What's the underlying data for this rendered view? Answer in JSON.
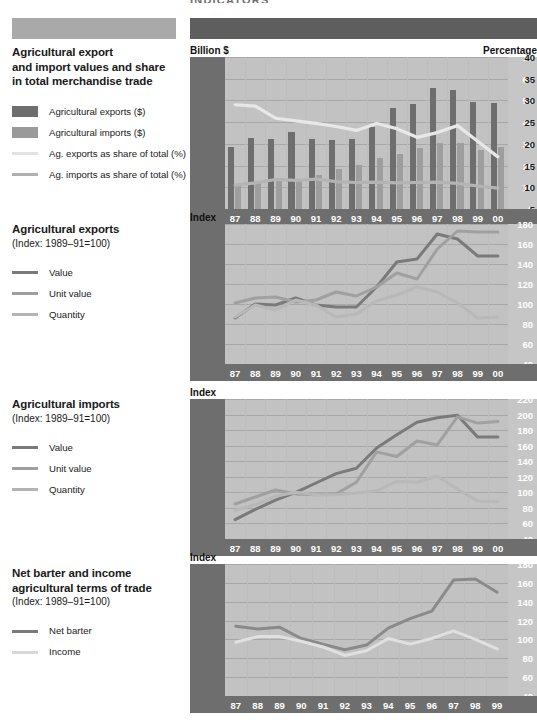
{
  "page": {
    "clipped_header_text": "INDICATORS",
    "header_bar_left_color": "#a9a9a9",
    "header_bar_right_color": "#5e5e5e"
  },
  "sections": [
    {
      "title_lines": [
        "Agricultural export",
        "and import values and share",
        "in total merchandise trade"
      ],
      "subtitle": "",
      "legend": [
        {
          "label": "Agricultural exports ($)",
          "swatch": "box",
          "color": "#6e6e6e"
        },
        {
          "label": "Agricultural imports ($)",
          "swatch": "box",
          "color": "#9a9a9a"
        },
        {
          "label": "Ag. exports as share of total (%)",
          "swatch": "line",
          "color": "#e3e3e3"
        },
        {
          "label": "Ag. imports as share of total (%)",
          "swatch": "line",
          "color": "#b0b0b0"
        }
      ],
      "left_caption": "Billion $",
      "right_caption": "Percentage"
    },
    {
      "title_lines": [
        "Agricultural exports"
      ],
      "subtitle": "(Index: 1989–91=100)",
      "legend": [
        {
          "label": "Value",
          "swatch": "line",
          "color": "#7a7a7a"
        },
        {
          "label": "Unit value",
          "swatch": "line",
          "color": "#9e9e9e"
        },
        {
          "label": "Quantity",
          "swatch": "line",
          "color": "#b4b4b4"
        }
      ],
      "left_caption": "Index",
      "right_caption": ""
    },
    {
      "title_lines": [
        "Agricultural imports"
      ],
      "subtitle": "(Index: 1989–91=100)",
      "legend": [
        {
          "label": "Value",
          "swatch": "line",
          "color": "#7a7a7a"
        },
        {
          "label": "Unit value",
          "swatch": "line",
          "color": "#9e9e9e"
        },
        {
          "label": "Quantity",
          "swatch": "line",
          "color": "#b4b4b4"
        }
      ],
      "left_caption": "Index",
      "right_caption": ""
    },
    {
      "title_lines": [
        "Net barter and income",
        "agricultural terms of trade"
      ],
      "subtitle": "(Index: 1989–91=100)",
      "legend": [
        {
          "label": "Net barter",
          "swatch": "line",
          "color": "#7a7a7a"
        },
        {
          "label": "Income",
          "swatch": "line",
          "color": "#d8d8d8"
        }
      ],
      "left_caption": "Index",
      "right_caption": ""
    }
  ],
  "chart_data": [
    {
      "type": "bar",
      "title": "Agricultural export and import values and share in total merchandise trade",
      "xlabel": "",
      "ylabel": "Billion $",
      "y2label": "Percentage",
      "categories": [
        "87",
        "88",
        "89",
        "90",
        "91",
        "92",
        "93",
        "94",
        "95",
        "96",
        "97",
        "98",
        "99",
        "00"
      ],
      "ylim": [
        0,
        70
      ],
      "yticks": [
        0,
        10,
        20,
        30,
        40,
        50,
        60,
        70
      ],
      "y2lim": [
        5,
        40
      ],
      "y2ticks": [
        5,
        10,
        15,
        20,
        25,
        30,
        35,
        40
      ],
      "grid": true,
      "legend_position": "left-panel",
      "series": [
        {
          "name": "Agricultural exports ($)",
          "kind": "bar",
          "axis": "left",
          "color": "#6e6e6e",
          "values": [
            28.7,
            32.5,
            32.3,
            35.3,
            32.4,
            32.0,
            32.2,
            38.0,
            46.3,
            48.5,
            55.7,
            54.8,
            49.3,
            48.9
          ]
        },
        {
          "name": "Agricultural imports ($)",
          "kind": "bar",
          "axis": "left",
          "color": "#9e9e9e",
          "values": [
            10.6,
            12.4,
            13.4,
            14.0,
            15.8,
            18.2,
            20.2,
            23.3,
            25.5,
            28.2,
            30.4,
            30.4,
            27.0,
            28.7
          ]
        },
        {
          "name": "Ag. exports as share of total (%)",
          "kind": "line",
          "axis": "right",
          "color": "#e8e8e8",
          "values": [
            29.0,
            28.7,
            25.9,
            25.3,
            24.7,
            24.0,
            23.1,
            24.7,
            23.5,
            21.5,
            22.6,
            24.2,
            20.6,
            17.0
          ]
        },
        {
          "name": "Ag. imports as share of total (%)",
          "kind": "line",
          "axis": "right",
          "color": "#b4b4b4",
          "values": [
            10.5,
            11.0,
            11.8,
            11.6,
            11.9,
            11.3,
            11.1,
            11.2,
            11.0,
            11.1,
            11.2,
            10.9,
            10.3,
            9.8
          ]
        }
      ]
    },
    {
      "type": "line",
      "title": "Agricultural exports (Index: 1989-91=100)",
      "xlabel": "",
      "ylabel": "Index",
      "categories": [
        "87",
        "88",
        "89",
        "90",
        "91",
        "92",
        "93",
        "94",
        "95",
        "96",
        "97",
        "98",
        "99",
        "00"
      ],
      "ylim": [
        40,
        180
      ],
      "yticks": [
        40,
        60,
        80,
        100,
        120,
        140,
        160,
        180
      ],
      "grid": true,
      "legend_position": "left-panel",
      "series": [
        {
          "name": "Value",
          "color": "#7a7a7a",
          "values": [
            86,
            100,
            99,
            106,
            99,
            97,
            97,
            117,
            142,
            145,
            170,
            165,
            148,
            148
          ]
        },
        {
          "name": "Unit value",
          "color": "#a0a0a0",
          "values": [
            101,
            106,
            107,
            102,
            104,
            112,
            108,
            117,
            131,
            125,
            155,
            173,
            172,
            172
          ]
        },
        {
          "name": "Quantity",
          "color": "#b8b8b8",
          "values": [
            87,
            99,
            94,
            104,
            99,
            87,
            90,
            103,
            109,
            117,
            112,
            101,
            86,
            87
          ]
        }
      ]
    },
    {
      "type": "line",
      "title": "Agricultural imports (Index: 1989-91=100)",
      "xlabel": "",
      "ylabel": "Index",
      "categories": [
        "87",
        "88",
        "89",
        "90",
        "91",
        "92",
        "93",
        "94",
        "95",
        "96",
        "97",
        "98",
        "99",
        "00"
      ],
      "ylim": [
        40,
        220
      ],
      "yticks": [
        40,
        60,
        80,
        100,
        120,
        140,
        160,
        180,
        200,
        220
      ],
      "grid": true,
      "legend_position": "left-panel",
      "series": [
        {
          "name": "Value",
          "color": "#7a7a7a",
          "values": [
            65,
            78,
            90,
            100,
            112,
            124,
            131,
            157,
            174,
            190,
            196,
            199,
            171,
            171
          ]
        },
        {
          "name": "Unit value",
          "color": "#a0a0a0",
          "values": [
            85,
            94,
            103,
            98,
            97,
            98,
            113,
            152,
            146,
            166,
            161,
            197,
            189,
            191
          ]
        },
        {
          "name": "Quantity",
          "color": "#b8b8b8",
          "values": [
            77,
            84,
            95,
            100,
            97,
            97,
            99,
            102,
            114,
            113,
            121,
            104,
            89,
            88
          ]
        }
      ]
    },
    {
      "type": "line",
      "title": "Net barter and income agricultural terms of trade (Index: 1989-91=100)",
      "xlabel": "",
      "ylabel": "Index",
      "categories": [
        "87",
        "88",
        "89",
        "90",
        "91",
        "92",
        "93",
        "94",
        "95",
        "96",
        "97",
        "98",
        "99"
      ],
      "ylim": [
        40,
        180
      ],
      "yticks": [
        40,
        60,
        80,
        100,
        120,
        140,
        160,
        180
      ],
      "grid": true,
      "legend_position": "left-panel",
      "series": [
        {
          "name": "Net barter",
          "color": "#8a8a8a",
          "values": [
            114,
            111,
            113,
            101,
            95,
            89,
            94,
            112,
            122,
            130,
            163,
            164,
            150
          ]
        },
        {
          "name": "Income",
          "color": "#e0e0e0",
          "values": [
            97,
            103,
            103,
            98,
            92,
            83,
            88,
            101,
            95,
            101,
            109,
            100,
            90
          ]
        }
      ]
    }
  ]
}
